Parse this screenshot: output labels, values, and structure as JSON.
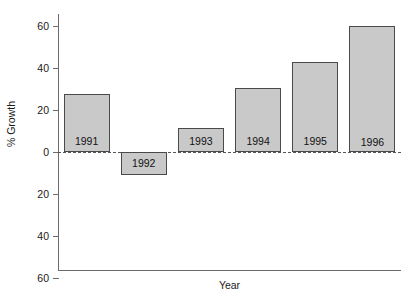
{
  "chart_data": {
    "type": "bar",
    "title": "",
    "xlabel": "Year",
    "ylabel": "% Growth",
    "categories": [
      "1991",
      "1992",
      "1993",
      "1994",
      "1995",
      "1996"
    ],
    "values": [
      27.6,
      -11.0,
      11.4,
      30.5,
      43.0,
      60.0
    ],
    "ylim": [
      -60,
      65
    ],
    "y_ticks": [
      60,
      40,
      20,
      0,
      20,
      40,
      60
    ],
    "y_tick_values": [
      60,
      40,
      20,
      0,
      -20,
      -40,
      -60
    ],
    "grid": false,
    "legend": "none",
    "zero_line": "dashed",
    "bar_fill_color": "#c9c9c9",
    "bar_border_color": "#4a4a4a",
    "axis_color": "#6b6b6b",
    "bar_labels": [
      "1991",
      "1992",
      "1993",
      "1994",
      "1995",
      "1996"
    ]
  }
}
